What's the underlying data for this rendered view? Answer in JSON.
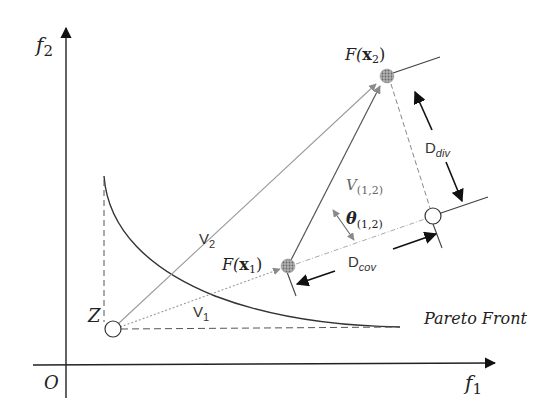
{
  "diagram": {
    "type": "pareto-front-geometry",
    "axes": {
      "y_label_main": "f",
      "y_label_sub": "2",
      "x_label_main": "f",
      "x_label_sub": "1",
      "origin_label": "O"
    },
    "points": {
      "ideal_point": {
        "label": "Z"
      },
      "solution_1": {
        "label_prefix": "F(",
        "label_var": "x",
        "label_sub": "1",
        "label_suffix": ")"
      },
      "solution_2": {
        "label_prefix": "F(",
        "label_var": "x",
        "label_sub": "2",
        "label_suffix": ")"
      }
    },
    "vectors": {
      "v1": {
        "main": "V",
        "sub": "1"
      },
      "v2": {
        "main": "V",
        "sub": "2"
      },
      "v12": {
        "main": "V",
        "sub": "(1,2)"
      }
    },
    "angle": {
      "main": "θ",
      "sub": "(1,2)"
    },
    "distances": {
      "coverage": {
        "main": "D",
        "sub": "cov"
      },
      "diversity": {
        "main": "D",
        "sub": "div"
      }
    },
    "curve_label": "Pareto Front",
    "colors": {
      "axis": "#222222",
      "curve": "#333333",
      "vector": "#9a9a9a",
      "dot_fill": "#8c8c8c"
    }
  }
}
